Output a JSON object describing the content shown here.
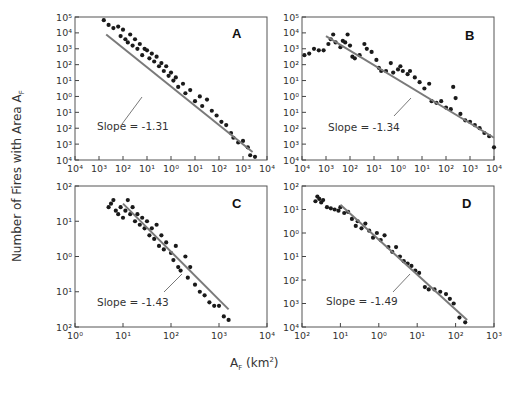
{
  "figure": {
    "y_axis_title": "Number of Fires with Area A",
    "y_axis_title_sub": "F",
    "x_axis_title": "A",
    "x_axis_title_sub": "F",
    "x_axis_title_unit": " (km",
    "x_axis_title_sup": "2",
    "x_axis_title_close": ")"
  },
  "chart_data": [
    {
      "panel": "A",
      "type": "scatter",
      "xlabel": "A_F (km^2)",
      "ylabel": "Number of Fires with Area A_F",
      "x_tick_labels": [
        "10^4",
        "10^3",
        "10^2",
        "10^1",
        "10^0",
        "10^1",
        "10^2",
        "10^3",
        "10^4"
      ],
      "y_tick_labels": [
        "10^5",
        "10^4",
        "10^3",
        "10^2",
        "10^1",
        "10^0",
        "10^1",
        "10^2",
        "10^3",
        "10^4"
      ],
      "x_decades": [
        -4,
        4
      ],
      "y_decades": [
        5,
        -4
      ],
      "annotation": "Slope = -1.31",
      "fit_slope": -1.31,
      "fit_line": [
        [
          -2.7,
          3.9
        ],
        [
          3.4,
          -3.5
        ]
      ],
      "points_log10": [
        [
          -2.8,
          4.8
        ],
        [
          -2.6,
          4.5
        ],
        [
          -2.4,
          4.3
        ],
        [
          -2.2,
          4.4
        ],
        [
          -2.1,
          3.8
        ],
        [
          -2.0,
          4.2
        ],
        [
          -1.9,
          3.6
        ],
        [
          -1.8,
          3.4
        ],
        [
          -1.7,
          3.9
        ],
        [
          -1.6,
          3.2
        ],
        [
          -1.5,
          3.6
        ],
        [
          -1.4,
          3.0
        ],
        [
          -1.3,
          3.3
        ],
        [
          -1.2,
          2.6
        ],
        [
          -1.1,
          3.0
        ],
        [
          -1.0,
          2.9
        ],
        [
          -0.9,
          2.4
        ],
        [
          -0.8,
          2.7
        ],
        [
          -0.7,
          2.2
        ],
        [
          -0.6,
          2.5
        ],
        [
          -0.5,
          1.9
        ],
        [
          -0.4,
          2.1
        ],
        [
          -0.3,
          1.6
        ],
        [
          -0.2,
          1.9
        ],
        [
          -0.1,
          1.3
        ],
        [
          0.0,
          1.5
        ],
        [
          0.1,
          1.0
        ],
        [
          0.2,
          1.2
        ],
        [
          0.3,
          0.6
        ],
        [
          0.5,
          0.8
        ],
        [
          0.6,
          0.2
        ],
        [
          0.8,
          0.4
        ],
        [
          1.0,
          -0.3
        ],
        [
          1.2,
          0.0
        ],
        [
          1.3,
          -0.6
        ],
        [
          1.5,
          -0.2
        ],
        [
          1.7,
          -0.9
        ],
        [
          1.9,
          -1.2
        ],
        [
          2.1,
          -1.6
        ],
        [
          2.3,
          -1.8
        ],
        [
          2.5,
          -2.3
        ],
        [
          2.6,
          -2.6
        ],
        [
          2.8,
          -2.9
        ],
        [
          3.0,
          -2.8
        ],
        [
          3.2,
          -3.2
        ],
        [
          3.3,
          -3.7
        ],
        [
          3.5,
          -3.8
        ]
      ]
    },
    {
      "panel": "B",
      "type": "scatter",
      "xlabel": "A_F (km^2)",
      "ylabel": "Number of Fires with Area A_F",
      "x_tick_labels": [
        "10^4",
        "10^3",
        "10^2",
        "10^1",
        "10^0",
        "10^1",
        "10^2",
        "10^3",
        "10^4"
      ],
      "y_tick_labels": [
        "10^5",
        "10^4",
        "10^3",
        "10^2",
        "10^1",
        "10^0",
        "10^1",
        "10^2",
        "10^3",
        "10^4"
      ],
      "x_decades": [
        -4,
        4
      ],
      "y_decades": [
        5,
        -4
      ],
      "annotation": "Slope = -1.34",
      "fit_slope": -1.34,
      "fit_line": [
        [
          -3.0,
          3.8
        ],
        [
          4.0,
          -2.6
        ]
      ],
      "points_log10": [
        [
          -3.9,
          2.6
        ],
        [
          -3.7,
          2.7
        ],
        [
          -3.5,
          3.0
        ],
        [
          -3.3,
          2.9
        ],
        [
          -3.1,
          2.9
        ],
        [
          -2.9,
          3.3
        ],
        [
          -2.8,
          3.6
        ],
        [
          -2.7,
          3.9
        ],
        [
          -2.6,
          3.4
        ],
        [
          -2.4,
          3.1
        ],
        [
          -2.3,
          3.5
        ],
        [
          -2.2,
          3.4
        ],
        [
          -2.1,
          3.9
        ],
        [
          -2.0,
          3.2
        ],
        [
          -1.9,
          2.5
        ],
        [
          -1.8,
          2.4
        ],
        [
          -1.6,
          2.6
        ],
        [
          -1.4,
          3.3
        ],
        [
          -1.3,
          3.0
        ],
        [
          -1.1,
          2.8
        ],
        [
          -0.9,
          2.3
        ],
        [
          -0.8,
          1.8
        ],
        [
          -0.7,
          1.6
        ],
        [
          -0.5,
          1.6
        ],
        [
          -0.3,
          2.1
        ],
        [
          -0.2,
          1.5
        ],
        [
          0.0,
          1.7
        ],
        [
          0.1,
          1.9
        ],
        [
          0.2,
          1.6
        ],
        [
          0.4,
          1.4
        ],
        [
          0.5,
          1.6
        ],
        [
          0.7,
          1.2
        ],
        [
          0.9,
          0.9
        ],
        [
          1.1,
          0.5
        ],
        [
          1.3,
          0.8
        ],
        [
          1.4,
          -0.3
        ],
        [
          1.6,
          -0.4
        ],
        [
          1.8,
          -0.3
        ],
        [
          2.0,
          -0.7
        ],
        [
          2.2,
          -0.8
        ],
        [
          2.3,
          0.6
        ],
        [
          2.4,
          -0.1
        ],
        [
          2.6,
          -1.1
        ],
        [
          2.8,
          -1.5
        ],
        [
          3.0,
          -1.6
        ],
        [
          3.2,
          -1.8
        ],
        [
          3.4,
          -2.0
        ],
        [
          3.6,
          -2.3
        ],
        [
          3.8,
          -2.5
        ],
        [
          4.0,
          -3.2
        ]
      ]
    },
    {
      "panel": "C",
      "type": "scatter",
      "xlabel": "A_F (km^2)",
      "ylabel": "Number of Fires with Area A_F",
      "x_tick_labels": [
        "10^0",
        "10^1",
        "10^2",
        "10^3",
        "10^4"
      ],
      "y_tick_labels": [
        "10^2",
        "10^1",
        "10^0",
        "10^1",
        "10^2"
      ],
      "x_decades": [
        0,
        4
      ],
      "y_decades": [
        2,
        -2
      ],
      "annotation": "Slope = -1.43",
      "fit_slope": -1.43,
      "fit_line": [
        [
          1.0,
          1.5
        ],
        [
          3.2,
          -1.5
        ]
      ],
      "points_log10": [
        [
          0.7,
          1.4
        ],
        [
          0.75,
          1.5
        ],
        [
          0.8,
          1.6
        ],
        [
          0.85,
          1.3
        ],
        [
          0.9,
          1.2
        ],
        [
          0.95,
          1.4
        ],
        [
          1.0,
          1.1
        ],
        [
          1.05,
          1.3
        ],
        [
          1.1,
          1.6
        ],
        [
          1.15,
          1.2
        ],
        [
          1.2,
          1.4
        ],
        [
          1.25,
          1.0
        ],
        [
          1.3,
          1.2
        ],
        [
          1.35,
          0.9
        ],
        [
          1.4,
          1.1
        ],
        [
          1.45,
          0.8
        ],
        [
          1.5,
          1.0
        ],
        [
          1.55,
          0.6
        ],
        [
          1.6,
          0.8
        ],
        [
          1.65,
          0.5
        ],
        [
          1.7,
          0.9
        ],
        [
          1.75,
          0.3
        ],
        [
          1.8,
          0.6
        ],
        [
          1.85,
          0.2
        ],
        [
          1.9,
          0.4
        ],
        [
          2.0,
          0.1
        ],
        [
          2.05,
          -0.1
        ],
        [
          2.1,
          0.3
        ],
        [
          2.15,
          -0.3
        ],
        [
          2.2,
          -0.4
        ],
        [
          2.3,
          0.0
        ],
        [
          2.35,
          -0.6
        ],
        [
          2.4,
          -0.3
        ],
        [
          2.5,
          -0.8
        ],
        [
          2.6,
          -1.0
        ],
        [
          2.7,
          -1.1
        ],
        [
          2.8,
          -1.3
        ],
        [
          2.9,
          -1.4
        ],
        [
          3.0,
          -1.4
        ],
        [
          3.1,
          -1.7
        ],
        [
          3.2,
          -1.8
        ]
      ]
    },
    {
      "panel": "D",
      "type": "scatter",
      "xlabel": "A_F (km^2)",
      "ylabel": "Number of Fires with Area A_F",
      "x_tick_labels": [
        "10^2",
        "10^1",
        "10^0",
        "10^1",
        "10^2",
        "10^3"
      ],
      "y_tick_labels": [
        "10^2",
        "10^1",
        "10^0",
        "10^1",
        "10^2",
        "10^3",
        "10^4"
      ],
      "x_decades": [
        -2,
        3
      ],
      "y_decades": [
        2,
        -4
      ],
      "annotation": "Slope = -1.49",
      "fit_slope": -1.49,
      "fit_line": [
        [
          -1.0,
          1.2
        ],
        [
          2.3,
          -3.7
        ]
      ],
      "points_log10": [
        [
          -1.65,
          1.35
        ],
        [
          -1.6,
          1.55
        ],
        [
          -1.55,
          1.45
        ],
        [
          -1.5,
          1.3
        ],
        [
          -1.45,
          1.4
        ],
        [
          -1.35,
          1.1
        ],
        [
          -1.25,
          1.05
        ],
        [
          -1.15,
          1.0
        ],
        [
          -1.05,
          0.95
        ],
        [
          -1.0,
          1.1
        ],
        [
          -0.9,
          0.85
        ],
        [
          -0.8,
          0.9
        ],
        [
          -0.7,
          0.6
        ],
        [
          -0.6,
          0.3
        ],
        [
          -0.55,
          0.5
        ],
        [
          -0.45,
          0.2
        ],
        [
          -0.35,
          0.4
        ],
        [
          -0.25,
          0.1
        ],
        [
          -0.15,
          -0.2
        ],
        [
          -0.05,
          0.0
        ],
        [
          0.05,
          -0.3
        ],
        [
          0.15,
          -0.1
        ],
        [
          0.25,
          -0.6
        ],
        [
          0.35,
          -0.8
        ],
        [
          0.45,
          -0.6
        ],
        [
          0.55,
          -1.0
        ],
        [
          0.65,
          -1.2
        ],
        [
          0.75,
          -1.3
        ],
        [
          0.85,
          -1.4
        ],
        [
          0.95,
          -1.6
        ],
        [
          1.05,
          -1.7
        ],
        [
          1.2,
          -2.3
        ],
        [
          1.3,
          -2.4
        ],
        [
          1.45,
          -2.4
        ],
        [
          1.6,
          -2.5
        ],
        [
          1.75,
          -2.6
        ],
        [
          1.85,
          -2.8
        ],
        [
          1.95,
          -3.0
        ],
        [
          2.1,
          -3.6
        ],
        [
          2.25,
          -3.8
        ]
      ]
    }
  ]
}
